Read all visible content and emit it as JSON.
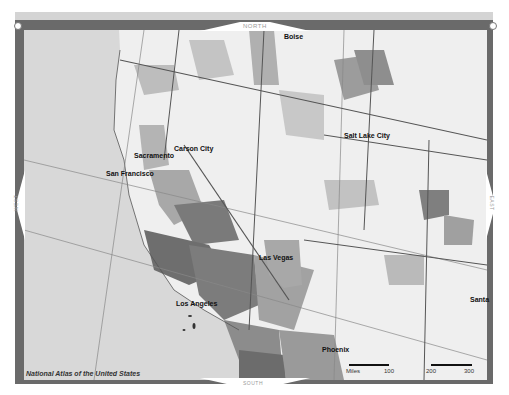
{
  "map": {
    "title": "Western United States county choropleth",
    "compass": {
      "north": "NORTH",
      "south": "SOUTH",
      "west": "WEST",
      "east": "EAST"
    },
    "cities": [
      {
        "name": "Boise",
        "x": 284,
        "y": 37
      },
      {
        "name": "Salt Lake City",
        "x": 344,
        "y": 134
      },
      {
        "name": "Carson City",
        "x": 174,
        "y": 147
      },
      {
        "name": "Sacramento",
        "x": 134,
        "y": 153
      },
      {
        "name": "San Francisco",
        "x": 106,
        "y": 171
      },
      {
        "name": "Las Vegas",
        "x": 259,
        "y": 255
      },
      {
        "name": "Los Angeles",
        "x": 176,
        "y": 300
      },
      {
        "name": "Phoenix",
        "x": 322,
        "y": 347
      },
      {
        "name": "Santa",
        "x": 470,
        "y": 297
      }
    ],
    "credit": "National Atlas of the United States",
    "scale": {
      "unit_label": "Miles",
      "ticks": [
        "100",
        "200",
        "300"
      ]
    },
    "colors": {
      "frame": "#6a6a6a",
      "ocean": "#d8d8d8",
      "land_light": "#efefef",
      "land_mid": "#b4b4b4",
      "land_dark": "#8a8a8a",
      "land_darkest": "#6e6e6e",
      "border": "#555555"
    }
  }
}
